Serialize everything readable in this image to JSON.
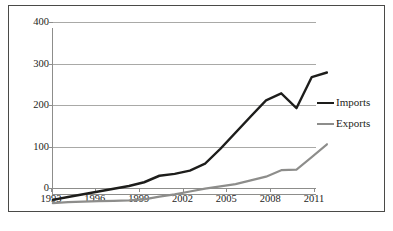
{
  "chart_data": {
    "type": "line",
    "title": "",
    "subtitle": "",
    "xlabel": "",
    "ylabel": "",
    "xlim": [
      1993,
      2011
    ],
    "ylim": [
      0,
      400
    ],
    "grid": true,
    "legend_position": "right",
    "x": [
      1993,
      1994,
      1995,
      1996,
      1997,
      1998,
      1999,
      2000,
      2001,
      2002,
      2003,
      2004,
      2005,
      2006,
      2007,
      2008,
      2009,
      2010,
      2011
    ],
    "x_ticks": [
      "1993",
      "1996",
      "1999",
      "2002",
      "2005",
      "2008",
      "2011"
    ],
    "x_tick_values": [
      1993,
      1996,
      1999,
      2002,
      2005,
      2008,
      2011
    ],
    "y_ticks": [
      "0",
      "100",
      "200",
      "300",
      "400"
    ],
    "y_tick_values": [
      0,
      100,
      200,
      300,
      400
    ],
    "series": [
      {
        "name": "Imports",
        "color": "#1d1d1b",
        "width": 2.2,
        "values": [
          20,
          26,
          32,
          38,
          44,
          50,
          58,
          72,
          76,
          83,
          98,
          130,
          165,
          200,
          235,
          250,
          218,
          285,
          295
        ]
      },
      {
        "name": "Exports",
        "color": "#8d8d8b",
        "width": 2.0,
        "values": [
          13,
          15,
          16,
          17,
          18,
          19,
          21,
          27,
          32,
          38,
          44,
          49,
          54,
          62,
          70,
          84,
          85,
          112,
          140
        ]
      }
    ]
  },
  "legend": {
    "items": [
      {
        "label": "Imports",
        "color": "#1d1d1b"
      },
      {
        "label": "Exports",
        "color": "#8d8d8b"
      }
    ]
  },
  "axes": {
    "y_labels": [
      "400",
      "300",
      "200",
      "100",
      "0"
    ],
    "x_labels": [
      "1993",
      "1996",
      "1999",
      "2002",
      "2005",
      "2008",
      "2011"
    ]
  },
  "artifact": {
    "text": ""
  }
}
